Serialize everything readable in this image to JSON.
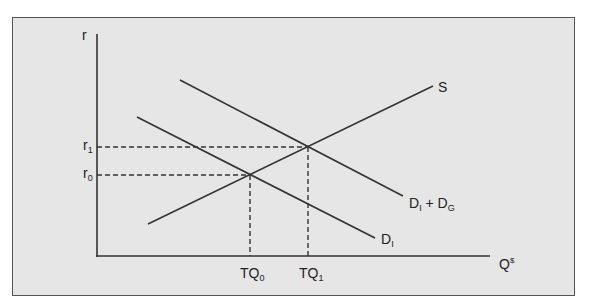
{
  "diagram": {
    "title": "",
    "y_axis_label": "r",
    "x_axis_label": {
      "main": "Q",
      "sup": "$"
    },
    "curves": [
      {
        "name": "supply",
        "label": {
          "main": "S",
          "sub": ""
        },
        "from": [
          148,
          224
        ],
        "to": [
          433,
          86
        ]
      },
      {
        "name": "private-demand",
        "label": {
          "main": "D",
          "sub": "I"
        },
        "from": [
          137,
          117
        ],
        "to": [
          375,
          238
        ]
      },
      {
        "name": "total-demand",
        "label": {
          "main": "D",
          "sub": "I",
          "plus": "+",
          "main2": "D",
          "sub2": "G"
        },
        "from": [
          180,
          80
        ],
        "to": [
          403,
          196
        ]
      }
    ],
    "y_ticks": [
      {
        "main": "r",
        "sub": "1",
        "y": 147
      },
      {
        "main": "r",
        "sub": "0",
        "y": 175
      }
    ],
    "x_ticks": [
      {
        "main": "TQ",
        "sub": "0",
        "x": 250
      },
      {
        "main": "TQ",
        "sub": "1",
        "x": 308
      }
    ],
    "equilibria": [
      {
        "name": "E0",
        "x": 250,
        "y": 175
      },
      {
        "name": "E1",
        "x": 308,
        "y": 147
      }
    ],
    "colors": {
      "background": "#e6e6e6",
      "line": "#333333",
      "frame": "#555555"
    }
  }
}
